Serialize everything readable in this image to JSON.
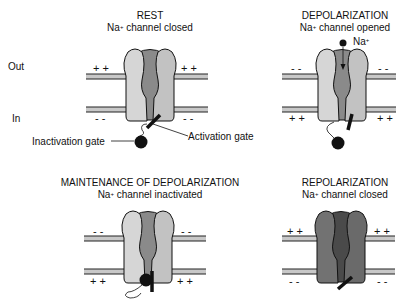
{
  "side_labels": {
    "out": "Out",
    "in": "In"
  },
  "panels": [
    {
      "id": "rest",
      "title": "REST",
      "subtitle_prefix": "Na",
      "subtitle_sup": "+",
      "subtitle_suffix": " channel closed",
      "outside_charge": "+ +",
      "inside_charge": "- -",
      "state": "closed"
    },
    {
      "id": "depolarization",
      "title": "DEPOLARIZATION",
      "subtitle_prefix": "Na",
      "subtitle_sup": "+",
      "subtitle_suffix": " channel opened",
      "ion_label_prefix": "Na",
      "ion_label_sup": "+",
      "outside_charge": "- -",
      "inside_charge": "+ +",
      "state": "open"
    },
    {
      "id": "maintenance",
      "title": "MAINTENANCE OF DEPOLARIZATION",
      "subtitle_prefix": "Na",
      "subtitle_sup": "+",
      "subtitle_suffix": " channel inactivated",
      "outside_charge": "- -",
      "inside_charge": "+ +",
      "state": "inactivated"
    },
    {
      "id": "repolarization",
      "title": "REPOLARIZATION",
      "subtitle_prefix": "Na",
      "subtitle_sup": "+",
      "subtitle_suffix": " channel closed",
      "outside_charge": "+ +",
      "inside_charge": "- -",
      "state": "closed"
    }
  ],
  "callouts": {
    "inactivation_gate": "Inactivation gate",
    "activation_gate": "Activation gate"
  },
  "colors": {
    "subunit_light": "#d2d2d2",
    "subunit_pore": "#8a8a8a",
    "subunit_dark": "#6e6e6e",
    "pore_dark": "#4a4a4a",
    "membrane_fill": "#c8c8c8",
    "outline": "#111111"
  }
}
